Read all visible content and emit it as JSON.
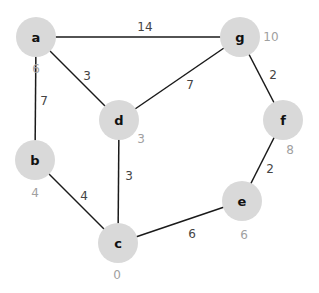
{
  "graph": {
    "nodes": [
      {
        "id": "a",
        "label": "a",
        "x": 36,
        "y": 37,
        "distance": "6",
        "dx": 36,
        "dy": 69
      },
      {
        "id": "g",
        "label": "g",
        "x": 240,
        "y": 37,
        "distance": "10",
        "dx": 271,
        "dy": 37
      },
      {
        "id": "d",
        "label": "d",
        "x": 119,
        "y": 120,
        "distance": "3",
        "dx": 141,
        "dy": 139
      },
      {
        "id": "f",
        "label": "f",
        "x": 283,
        "y": 120,
        "distance": "8",
        "dx": 290,
        "dy": 150
      },
      {
        "id": "b",
        "label": "b",
        "x": 35,
        "y": 160,
        "distance": "4",
        "dx": 35,
        "dy": 193
      },
      {
        "id": "e",
        "label": "e",
        "x": 242,
        "y": 201,
        "distance": "6",
        "dx": 244,
        "dy": 235
      },
      {
        "id": "c",
        "label": "c",
        "x": 118,
        "y": 243,
        "distance": "0",
        "dx": 117,
        "dy": 275
      }
    ],
    "edges": [
      {
        "from": "a",
        "to": "g",
        "weight": "14",
        "lx": 145,
        "ly": 27
      },
      {
        "from": "a",
        "to": "d",
        "weight": "3",
        "lx": 87,
        "ly": 76
      },
      {
        "from": "a",
        "to": "b",
        "weight": "7",
        "lx": 44,
        "ly": 101
      },
      {
        "from": "g",
        "to": "d",
        "weight": "7",
        "lx": 190,
        "ly": 85
      },
      {
        "from": "g",
        "to": "f",
        "weight": "2",
        "lx": 273,
        "ly": 75
      },
      {
        "from": "d",
        "to": "c",
        "weight": "3",
        "lx": 129,
        "ly": 176
      },
      {
        "from": "b",
        "to": "c",
        "weight": "4",
        "lx": 84,
        "ly": 196
      },
      {
        "from": "f",
        "to": "e",
        "weight": "2",
        "lx": 270,
        "ly": 169
      },
      {
        "from": "c",
        "to": "e",
        "weight": "6",
        "lx": 192,
        "ly": 234
      }
    ]
  }
}
